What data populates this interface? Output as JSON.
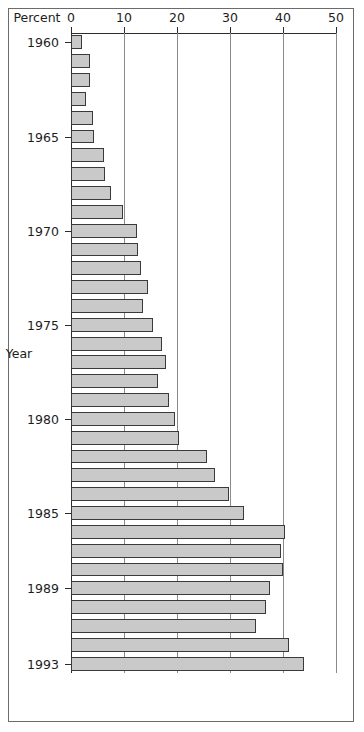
{
  "figure": {
    "frame_color": "#6b6b6b",
    "bar_fill": "#c9c9c9",
    "bar_edge": "#3a3a3a",
    "grid_color": "#8a8a8a",
    "axis_color": "#2b2b2b"
  },
  "chart_data": {
    "type": "bar",
    "orientation": "horizontal-rotated",
    "title": "",
    "subtitle": "",
    "xlabel": "Year",
    "ylabel": "Percent",
    "ylim": [
      0,
      50
    ],
    "yticks": [
      0,
      10,
      20,
      30,
      40,
      50
    ],
    "ytick_labels": [
      "0",
      "10",
      "20",
      "30",
      "40",
      "50"
    ],
    "xticks": [
      1960,
      1965,
      1970,
      1975,
      1980,
      1985,
      1989,
      1993
    ],
    "xtick_labels": [
      "1960",
      "1965",
      "1970",
      "1975",
      "1980",
      "1985",
      "1989",
      "1993"
    ],
    "grid": true,
    "grid_axis": "percent",
    "legend": "none",
    "categories": [
      "1960",
      "1961",
      "1962",
      "1963",
      "1964",
      "1965",
      "1966",
      "1967",
      "1968",
      "1969",
      "1970",
      "1971",
      "1972",
      "1973",
      "1974",
      "1975",
      "1976",
      "1977",
      "1978",
      "1979",
      "1980",
      "1981",
      "1982",
      "1983",
      "1984",
      "1985",
      "1986",
      "1987",
      "1988",
      "1989",
      "1990",
      "1991",
      "1992",
      "1993"
    ],
    "values": [
      2.0,
      3.5,
      3.6,
      2.8,
      4.2,
      4.4,
      6.2,
      6.4,
      7.6,
      9.8,
      12.4,
      12.6,
      13.2,
      14.6,
      13.6,
      15.4,
      17.2,
      18.0,
      16.4,
      18.4,
      19.6,
      20.4,
      25.6,
      27.2,
      29.8,
      32.6,
      40.4,
      39.6,
      40.0,
      37.6,
      36.8,
      35.0,
      41.2,
      44.0
    ]
  }
}
